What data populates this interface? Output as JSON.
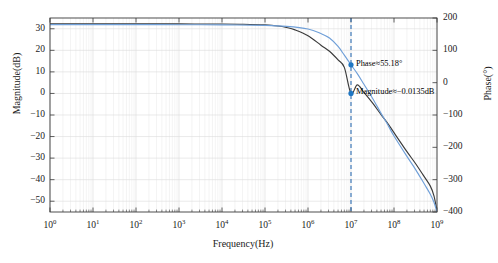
{
  "chart_data": {
    "type": "line",
    "title": "",
    "xlabel": "Frequency(Hz)",
    "ylabel": "Magnitude(dB)",
    "ylabel_right": "Phase(°)",
    "xscale": "log",
    "xlim": [
      1,
      1000000000
    ],
    "ylim": [
      -55,
      35
    ],
    "ylim_right": [
      -400,
      200
    ],
    "grid": true,
    "legend": "none",
    "xticks": [
      {
        "value": 1,
        "label": "10",
        "exponent": "0"
      },
      {
        "value": 10,
        "label": "10",
        "exponent": "1"
      },
      {
        "value": 100,
        "label": "10",
        "exponent": "2"
      },
      {
        "value": 1000,
        "label": "10",
        "exponent": "3"
      },
      {
        "value": 10000,
        "label": "10",
        "exponent": "4"
      },
      {
        "value": 100000,
        "label": "10",
        "exponent": "5"
      },
      {
        "value": 1000000,
        "label": "10",
        "exponent": "6"
      },
      {
        "value": 10000000,
        "label": "10",
        "exponent": "7"
      },
      {
        "value": 100000000,
        "label": "10",
        "exponent": "8"
      },
      {
        "value": 1000000000,
        "label": "10",
        "exponent": "9"
      }
    ],
    "yticks_left": [
      30,
      20,
      10,
      0,
      -10,
      -20,
      -30,
      -40,
      -50
    ],
    "yticks_right": [
      200,
      100,
      0,
      -100,
      -200,
      -300,
      -400
    ],
    "series": [
      {
        "name": "Magnitude",
        "axis": "left",
        "color": "#3a3a3a",
        "unit": "dB",
        "points": [
          [
            1,
            32.3
          ],
          [
            10,
            32.3
          ],
          [
            100,
            32.3
          ],
          [
            1000,
            32.25
          ],
          [
            10000,
            32.2
          ],
          [
            31623,
            32.1
          ],
          [
            100000,
            31.8
          ],
          [
            200000,
            31.3
          ],
          [
            316228,
            30.6
          ],
          [
            500000,
            29.5
          ],
          [
            1000000,
            26.8
          ],
          [
            2000000,
            22.4
          ],
          [
            3162278,
            19.6
          ],
          [
            5000000,
            15.6
          ],
          [
            7000000,
            12.1
          ],
          [
            10000000,
            -0.0135
          ],
          [
            14000000,
            4.0
          ],
          [
            20000000,
            0.5
          ],
          [
            31622777,
            -4.4
          ],
          [
            50000000,
            -9.8
          ],
          [
            70000000,
            -13.6
          ],
          [
            100000000,
            -18.2
          ],
          [
            200000000,
            -27.0
          ],
          [
            316227766,
            -32.5
          ],
          [
            500000000,
            -38.5
          ],
          [
            700000000,
            -43.0
          ],
          [
            850000000,
            -47.5
          ],
          [
            1000000000,
            -54.5
          ]
        ]
      },
      {
        "name": "Phase",
        "axis": "right",
        "color": "#6f9fd8",
        "unit": "°",
        "points": [
          [
            1,
            179.5
          ],
          [
            10,
            179.5
          ],
          [
            100,
            179.4
          ],
          [
            1000,
            179.2
          ],
          [
            10000,
            178.8
          ],
          [
            100000,
            177.0
          ],
          [
            316228,
            174.0
          ],
          [
            1000000,
            166.0
          ],
          [
            2000000,
            152.0
          ],
          [
            3162278,
            138.0
          ],
          [
            5000000,
            112.0
          ],
          [
            7000000,
            85.0
          ],
          [
            10000000,
            55.18
          ],
          [
            14000000,
            28.0
          ],
          [
            20000000,
            -5.0
          ],
          [
            31622777,
            -48.0
          ],
          [
            50000000,
            -95.0
          ],
          [
            70000000,
            -128.0
          ],
          [
            100000000,
            -165.0
          ],
          [
            200000000,
            -228.0
          ],
          [
            316227766,
            -268.0
          ],
          [
            500000000,
            -312.0
          ],
          [
            700000000,
            -345.0
          ],
          [
            850000000,
            -370.0
          ],
          [
            1000000000,
            -399.0
          ]
        ]
      }
    ],
    "cursor": {
      "x_value": 10000000,
      "style": "dashed-vertical",
      "color": "#2f6fb5"
    },
    "annotations": [
      {
        "name": "phase-annotation",
        "text": "Phase≈55.18°",
        "marker_x": 10000000,
        "marker_y": 55.18,
        "axis": "right",
        "marker_color": "#1f77c4"
      },
      {
        "name": "magnitude-annotation",
        "text": "Magnitude≈−0.0135dB",
        "marker_x": 10000000,
        "marker_y": -0.0135,
        "axis": "left",
        "marker_color": "#1f77c4"
      }
    ]
  },
  "figure": {
    "background": "#ffffff",
    "axis_color": "#3a3a3a",
    "grid_color": "#e6e6e6"
  }
}
